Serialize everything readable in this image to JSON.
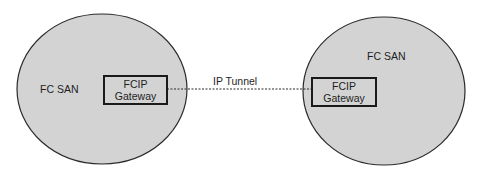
{
  "left_san": {
    "label": "FC SAN",
    "gateway": {
      "line1": "FCIP",
      "line2": "Gateway"
    }
  },
  "right_san": {
    "label": "FC SAN",
    "gateway": {
      "line1": "FCIP",
      "line2": "Gateway"
    }
  },
  "tunnel": {
    "label": "IP Tunnel"
  },
  "colors": {
    "san_fill": "#d3d3d3",
    "stroke": "#1a1a1a",
    "background": "#ffffff"
  }
}
